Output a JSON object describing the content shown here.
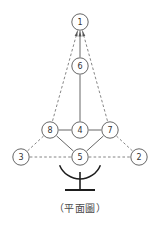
{
  "figure": {
    "caption": "（平面圖）",
    "type": "node-link-diagram",
    "view_name": "平面圖",
    "background_color": "#ffffff"
  },
  "style": {
    "node_stroke_color": "#555555",
    "node_fill_color": "#ffffff",
    "node_label_color": "#333333",
    "solid_edge_color": "#555555",
    "dashed_edge_color": "#777777",
    "base_color": "#1d1d1d",
    "caption_color": "#4a4a4a",
    "node_radius": 8.2
  },
  "nodes": [
    {
      "id": "1",
      "label": "1",
      "x": 80,
      "y": 22,
      "role": "apex"
    },
    {
      "id": "6",
      "label": "6",
      "x": 80,
      "y": 66,
      "role": "upper-middle"
    },
    {
      "id": "8",
      "label": "8",
      "x": 50,
      "y": 130,
      "role": "mid-left"
    },
    {
      "id": "4",
      "label": "4",
      "x": 80,
      "y": 130,
      "role": "mid-center"
    },
    {
      "id": "7",
      "label": "7",
      "x": 110,
      "y": 130,
      "role": "mid-right"
    },
    {
      "id": "3",
      "label": "3",
      "x": 21,
      "y": 157,
      "role": "lower-left"
    },
    {
      "id": "5",
      "label": "5",
      "x": 80,
      "y": 157,
      "role": "lower-center"
    },
    {
      "id": "2",
      "label": "2",
      "x": 139,
      "y": 157,
      "role": "lower-right"
    }
  ],
  "edges": [
    {
      "id": "e-1-6",
      "from": "1",
      "to": "6",
      "style": "solid",
      "arrow_at": "1"
    },
    {
      "id": "e-6-4",
      "from": "6",
      "to": "4",
      "style": "solid",
      "arrow_at": "none"
    },
    {
      "id": "e-8-4",
      "from": "8",
      "to": "4",
      "style": "solid",
      "arrow_at": "none"
    },
    {
      "id": "e-4-7",
      "from": "4",
      "to": "7",
      "style": "solid",
      "arrow_at": "none"
    },
    {
      "id": "e-8-5",
      "from": "8",
      "to": "5",
      "style": "solid",
      "arrow_at": "none"
    },
    {
      "id": "e-5-7",
      "from": "5",
      "to": "7",
      "style": "solid",
      "arrow_at": "none"
    },
    {
      "id": "e-1-8",
      "from": "1",
      "to": "8",
      "style": "dashed",
      "arrow_at": "1"
    },
    {
      "id": "e-8-3",
      "from": "8",
      "to": "3",
      "style": "dashed",
      "arrow_at": "none"
    },
    {
      "id": "e-1-7",
      "from": "1",
      "to": "7",
      "style": "dashed",
      "arrow_at": "1"
    },
    {
      "id": "e-7-2",
      "from": "7",
      "to": "2",
      "style": "dashed",
      "arrow_at": "none"
    },
    {
      "id": "e-3-5",
      "from": "3",
      "to": "5",
      "style": "dashed",
      "arrow_at": "none"
    },
    {
      "id": "e-5-2",
      "from": "5",
      "to": "2",
      "style": "dashed",
      "arrow_at": "none"
    }
  ],
  "base": {
    "arc_label": "base-arc",
    "mast_label": "base-mast",
    "foot_label": "base-foot",
    "arc_center_x": 80,
    "arc_center_y": 157,
    "arc_radius": 22,
    "mast_top_y": 172,
    "mast_bottom_y": 190,
    "foot_half_width": 15,
    "foot_y": 190
  }
}
